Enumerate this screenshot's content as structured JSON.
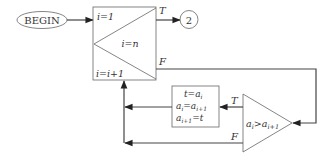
{
  "diagram": {
    "type": "flowchart",
    "begin_label": "BEGIN",
    "connector_label": "2",
    "loop": {
      "init": "i=1",
      "condition": "i=n",
      "increment": "i=i+1",
      "true_label": "T",
      "false_label": "F"
    },
    "swap": {
      "line1": "t=a",
      "line1_sub": "i",
      "line2": "a",
      "line2_sub": "i",
      "line2_mid": "=a",
      "line2_sub2": "i+1",
      "line3": "a",
      "line3_sub": "i+1",
      "line3_end": "=t"
    },
    "compare": {
      "text": "a",
      "sub1": "i",
      "op": ">a",
      "sub2": "i+1",
      "true_label": "T",
      "false_label": "F"
    }
  }
}
